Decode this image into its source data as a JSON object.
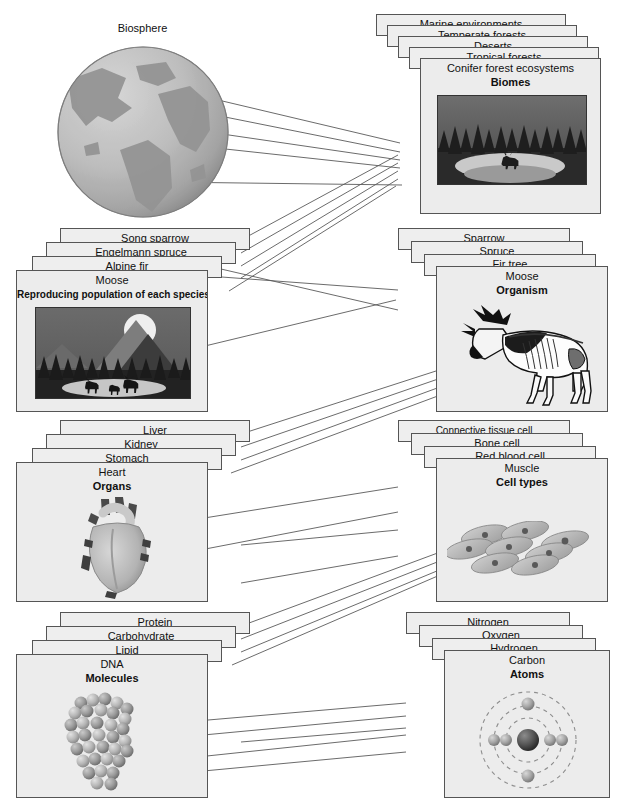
{
  "diagram": {
    "title_visible": false,
    "globe": {
      "label": "Biosphere",
      "x": 57,
      "y": 40,
      "d": 170
    },
    "levels": [
      {
        "id": "biomes",
        "group_label": "Biomes",
        "front_label": "Conifer forest ecosystems",
        "back_labels": [
          "Marine environments",
          "Temperate forests",
          "Deserts",
          "Tropical forests"
        ],
        "image_name": "conifer-forest-ecosystem-thumb",
        "column": "right",
        "x": 376,
        "y": 14,
        "w": 225,
        "h": 195
      },
      {
        "id": "populations",
        "group_label": "Reproducing population of each species",
        "front_label": "Moose",
        "back_labels": [
          "Song sparrow",
          "Engelmann spruce",
          "Alpine fir"
        ],
        "image_name": "moose-population-thumb",
        "column": "left",
        "x": 16,
        "y": 228,
        "w": 225,
        "h": 180
      },
      {
        "id": "organism",
        "group_label": "Organism",
        "front_label": "Moose",
        "back_labels": [
          "Sparrow",
          "Spruce",
          "Fir tree"
        ],
        "image_name": "moose-organism-thumb",
        "column": "right",
        "x": 398,
        "y": 228,
        "w": 212,
        "h": 180
      },
      {
        "id": "organs",
        "group_label": "Organs",
        "front_label": "Heart",
        "back_labels": [
          "Liver",
          "Kidney",
          "Stomach"
        ],
        "image_name": "heart-thumb",
        "column": "left",
        "x": 16,
        "y": 420,
        "w": 225,
        "h": 178
      },
      {
        "id": "cells",
        "group_label": "Cell types",
        "front_label": "Muscle",
        "back_labels": [
          "Connective tissue cell",
          "Bone cell",
          "Red blood cell"
        ],
        "image_name": "muscle-cells-thumb",
        "column": "right",
        "x": 398,
        "y": 420,
        "w": 212,
        "h": 178
      },
      {
        "id": "molecules",
        "group_label": "Molecules",
        "front_label": "DNA",
        "back_labels": [
          "Protein",
          "Carbohydrate",
          "Lipid"
        ],
        "image_name": "dna-molecule-thumb",
        "column": "left",
        "x": 16,
        "y": 612,
        "w": 225,
        "h": 182
      },
      {
        "id": "atoms",
        "group_label": "Atoms",
        "front_label": "Carbon",
        "back_labels": [
          "Nitrogen",
          "Oxygen",
          "Hydrogen"
        ],
        "image_name": "carbon-atom-thumb",
        "column": "right",
        "x": 406,
        "y": 612,
        "w": 204,
        "h": 182
      }
    ],
    "colors": {
      "card_fill": "#eeeeee",
      "card_border": "#555555",
      "line": "#555555",
      "text": "#111111",
      "globe_ocean": "#b9b9b9",
      "globe_land": "#8d8d8d"
    },
    "connectors": {
      "count": 24,
      "description": "thin straight lines linking each hierarchy level to the next"
    }
  }
}
